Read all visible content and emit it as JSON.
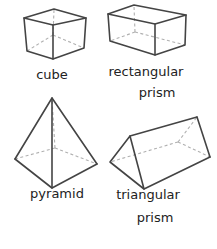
{
  "colors": {
    "background": "#ffffff",
    "edge": "#444444",
    "hidden_edge": "#b0b0b0",
    "text": "#222222"
  },
  "shapes": [
    {
      "id": "cube",
      "label_lines": [
        "cube"
      ]
    },
    {
      "id": "rectangular-prism",
      "label_lines": [
        "rectangular",
        "prism"
      ]
    },
    {
      "id": "pyramid",
      "label_lines": [
        "pyramid"
      ]
    },
    {
      "id": "triangular-prism",
      "label_lines": [
        "triangular",
        "prism"
      ]
    }
  ]
}
